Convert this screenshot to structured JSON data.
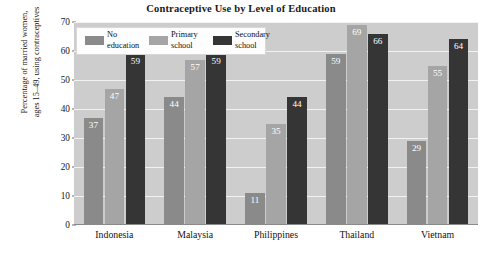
{
  "chart_data": {
    "type": "bar",
    "title": "Contraceptive Use by Level of Education",
    "xlabel": "",
    "ylabel_lines": [
      "Percentage of married women,",
      "ages 15–49, using contraceptives"
    ],
    "ylabel": "Percentage of married women, ages 15–49, using contraceptives",
    "categories": [
      "Indonesia",
      "Malaysia",
      "Philippines",
      "Thailand",
      "Vietnam"
    ],
    "series": [
      {
        "name": "No education",
        "name_lines": [
          "No",
          "education"
        ],
        "color": "#8a8a8a",
        "values": [
          37,
          44,
          11,
          59,
          29
        ]
      },
      {
        "name": "Primary school",
        "name_lines": [
          "Primary",
          "school"
        ],
        "color": "#a5a5a5",
        "values": [
          47,
          57,
          35,
          69,
          55
        ]
      },
      {
        "name": "Secondary school",
        "name_lines": [
          "Secondary",
          "school"
        ],
        "color": "#353535",
        "values": [
          59,
          59,
          44,
          66,
          64
        ]
      }
    ],
    "ylim": [
      0,
      70
    ],
    "yticks": [
      0,
      10,
      20,
      30,
      40,
      50,
      60,
      70
    ],
    "ytick_labels": [
      "0",
      "10",
      "20",
      "30",
      "40",
      "50",
      "60",
      "70"
    ],
    "grid": true,
    "grid_color": "#f2f2f2",
    "plot_background": "#cdcdcd",
    "figure_background": "#ffffff",
    "legend_position": "upper left",
    "value_labels_shown": true,
    "value_label_color": "#ffffff"
  }
}
